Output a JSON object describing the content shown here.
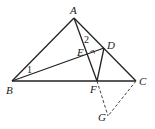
{
  "points": {
    "A": {
      "label": "A",
      "x": 74,
      "y": 18
    },
    "B": {
      "label": "B",
      "x": 12,
      "y": 81
    },
    "C": {
      "label": "C",
      "x": 136,
      "y": 81
    },
    "D": {
      "label": "D",
      "x": 104,
      "y": 48
    },
    "E": {
      "label": "E",
      "x": 88,
      "y": 54
    },
    "F": {
      "label": "F",
      "x": 97,
      "y": 81
    },
    "G": {
      "label": "G",
      "x": 108,
      "y": 116
    }
  },
  "angles": {
    "one": "1",
    "two": "2"
  },
  "colors": {
    "line": "#222222",
    "dashed": "#444444"
  }
}
